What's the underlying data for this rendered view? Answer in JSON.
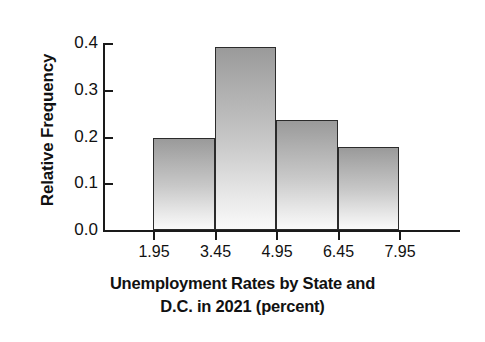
{
  "chart_data": {
    "type": "bar",
    "title": "",
    "xlabel_line1": "Unemployment Rates by State and",
    "xlabel_line2": "D.C. in 2021 (percent)",
    "xlabel": "Unemployment Rates by State and D.C. in 2021 (percent)",
    "ylabel": "Relative Frequency",
    "grid": false,
    "legend": "none",
    "xlim": [
      1.95,
      7.95
    ],
    "ylim": [
      0.0,
      0.4
    ],
    "bin_width": 1.5,
    "bin_edges": [
      1.95,
      3.45,
      4.95,
      6.45,
      7.95
    ],
    "xticks": [
      "1.95",
      "3.45",
      "4.95",
      "6.45",
      "7.95"
    ],
    "xtick_values": [
      1.95,
      3.45,
      4.95,
      6.45,
      7.95
    ],
    "yticks": [
      "0.0",
      "0.1",
      "0.2",
      "0.3",
      "0.4"
    ],
    "ytick_values": [
      0.0,
      0.1,
      0.2,
      0.3,
      0.4
    ],
    "categories": [
      "1.95-3.45",
      "3.45-4.95",
      "4.95-6.45",
      "6.45-7.95"
    ],
    "values": [
      0.196,
      0.392,
      0.235,
      0.177
    ],
    "bars": [
      {
        "label": "1.95-3.45",
        "left": 1.95,
        "right": 3.45,
        "value": 0.196
      },
      {
        "label": "3.45-4.95",
        "left": 3.45,
        "right": 4.95,
        "value": 0.392
      },
      {
        "label": "4.95-6.45",
        "left": 4.95,
        "right": 6.45,
        "value": 0.235
      },
      {
        "label": "6.45-7.95",
        "left": 6.45,
        "right": 7.95,
        "value": 0.177
      }
    ],
    "colors": {
      "bar_top": "#9a9a9a",
      "bar_bottom": "#fafafa",
      "bar_edge": "#2b2b2b",
      "axis": "#1a1a1a",
      "background": "#ffffff",
      "text": "#111111"
    }
  }
}
